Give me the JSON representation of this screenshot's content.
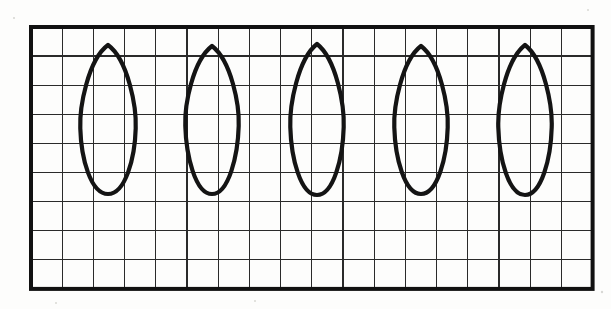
{
  "figure": {
    "background_color": "#fdfdfc",
    "line_color": "#2a2a2a",
    "frame_color": "#111111",
    "shape_color": "#141414"
  },
  "grid": {
    "name": "graph-paper-grid",
    "columns": 18,
    "rows": 9,
    "cell_width": 31.2,
    "cell_height": 29.1,
    "origin_x": 31,
    "origin_y": 27,
    "width": 561.6,
    "height": 261.9,
    "frame_stroke_width": 4,
    "line_stroke_width": 1.35
  },
  "shapes": {
    "count": 5,
    "type": "petal-outline",
    "label": "vertical teardrop outline, pointed apex, rounded base",
    "items": [
      {
        "index": 1,
        "name": "petal-shape-1",
        "apex_x": 108,
        "apex_y": 45,
        "base_y": 194,
        "half_width": 28,
        "belly_y_ratio": 0.56
      },
      {
        "index": 2,
        "name": "petal-shape-2",
        "apex_x": 212,
        "apex_y": 46,
        "base_y": 194,
        "half_width": 27,
        "belly_y_ratio": 0.54
      },
      {
        "index": 3,
        "name": "petal-shape-3",
        "apex_x": 317,
        "apex_y": 44,
        "base_y": 195,
        "half_width": 27,
        "belly_y_ratio": 0.55
      },
      {
        "index": 4,
        "name": "petal-shape-4",
        "apex_x": 421,
        "apex_y": 46,
        "base_y": 194,
        "half_width": 27,
        "belly_y_ratio": 0.55
      },
      {
        "index": 5,
        "name": "petal-shape-5",
        "apex_x": 525,
        "apex_y": 45,
        "base_y": 195,
        "half_width": 27,
        "belly_y_ratio": 0.55
      }
    ]
  }
}
